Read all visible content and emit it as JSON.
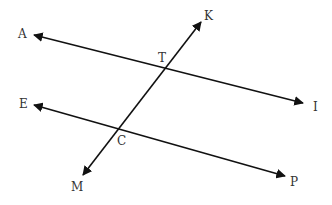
{
  "diagram": {
    "type": "geometry-parallel-lines-transversal",
    "colors": {
      "line": "#111111",
      "label": "#333333",
      "background": "#ffffff"
    },
    "lines": [
      {
        "name": "line-AI",
        "from": "A",
        "to": "I",
        "arrows": "both"
      },
      {
        "name": "line-EP",
        "from": "E",
        "to": "P",
        "arrows": "both"
      },
      {
        "name": "transversal-KM",
        "from": "K",
        "to": "M",
        "arrows": "both"
      }
    ],
    "intersections": [
      {
        "label": "T",
        "lines": [
          "line-AI",
          "transversal-KM"
        ]
      },
      {
        "label": "C",
        "lines": [
          "line-EP",
          "transversal-KM"
        ]
      }
    ]
  },
  "labels": {
    "A": "A",
    "I": "I",
    "E": "E",
    "P": "P",
    "K": "K",
    "M": "M",
    "T": "T",
    "C": "C"
  }
}
